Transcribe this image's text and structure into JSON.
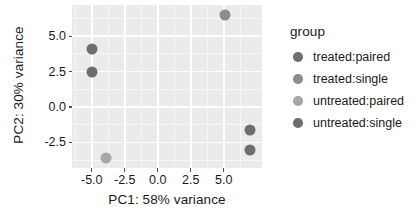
{
  "chart_data": {
    "type": "scatter",
    "title": "",
    "xlabel": "PC1: 58% variance",
    "ylabel": "PC2: 30% variance",
    "xlim": [
      -6.5,
      7.9
    ],
    "ylim": [
      -4.3,
      7.2
    ],
    "xticks": [
      "-5.0",
      "-2.5",
      "0.0",
      "2.5",
      "5.0"
    ],
    "xtick_values": [
      -5.0,
      -2.5,
      0.0,
      2.5,
      5.0
    ],
    "yticks": [
      "5.0",
      "2.5",
      "0.0",
      "-2.5"
    ],
    "ytick_values": [
      5.0,
      2.5,
      0.0,
      -2.5
    ],
    "grid": true,
    "legend_position": "right",
    "legend_title": "group",
    "series": [
      {
        "name": "treated:paired",
        "color": "#6e6e6e",
        "points": [
          {
            "x": -5.0,
            "y": 4.1
          },
          {
            "x": -5.0,
            "y": 2.45
          }
        ]
      },
      {
        "name": "treated:single",
        "color": "#8c8c8c",
        "points": [
          {
            "x": 5.1,
            "y": 6.5
          }
        ]
      },
      {
        "name": "untreated:paired",
        "color": "#a8a8a8",
        "points": [
          {
            "x": -3.9,
            "y": -3.6
          }
        ]
      },
      {
        "name": "untreated:single",
        "color": "#6e6e6e",
        "points": [
          {
            "x": 7.0,
            "y": -1.6
          },
          {
            "x": 7.0,
            "y": -3.0
          }
        ]
      }
    ]
  },
  "axes": {
    "x_title": "PC1: 58% variance",
    "y_title": "PC2: 30% variance",
    "x_tick_labels": [
      "-5.0",
      "-2.5",
      "0.0",
      "2.5",
      "5.0"
    ],
    "y_tick_labels": [
      "5.0",
      "2.5",
      "0.0",
      "-2.5"
    ]
  },
  "legend": {
    "title": "group",
    "items": [
      {
        "label": "treated:paired",
        "color": "#6e6e6e"
      },
      {
        "label": "treated:single",
        "color": "#8c8c8c"
      },
      {
        "label": "untreated:paired",
        "color": "#a8a8a8"
      },
      {
        "label": "untreated:single",
        "color": "#6e6e6e"
      }
    ]
  },
  "theme": {
    "panel_background": "#ebebeb",
    "gridline_major": "#ffffff",
    "gridline_minor": "#f7f7f7",
    "text_color": "#1a1a1a",
    "page_background": "#ffffff"
  }
}
